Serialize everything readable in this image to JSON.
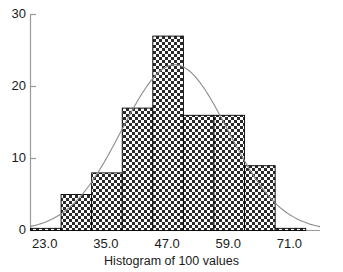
{
  "chart_data": {
    "type": "bar",
    "title": "",
    "xlabel": "Histogram of 100 values",
    "ylabel": "",
    "xlim": [
      20.2,
      77.0
    ],
    "ylim": [
      0,
      30
    ],
    "grid": false,
    "legend": null,
    "bin_width": 6,
    "bin_edges": [
      20.2,
      26.2,
      32.2,
      38.2,
      44.2,
      50.2,
      56.2,
      62.2,
      68.2,
      74.2
    ],
    "categories": [
      "20.2-26.2",
      "26.2-32.2",
      "32.2-38.2",
      "38.2-44.2",
      "44.2-50.2",
      "50.2-56.2",
      "56.2-62.2",
      "62.2-68.2",
      "68.2-74.2"
    ],
    "values": [
      0.3,
      5,
      8,
      17,
      27,
      16,
      16,
      9,
      0.3
    ],
    "xticks": [
      23.0,
      35.0,
      47.0,
      59.0,
      71.0
    ],
    "xtick_labels": [
      "23.0",
      "35.0",
      "47.0",
      "59.0",
      "71.0"
    ],
    "yticks": [
      0,
      10,
      20,
      30
    ],
    "ytick_labels": [
      "0",
      "10",
      "20",
      "30"
    ],
    "overlay": {
      "name": "normal-density-curve",
      "type": "line",
      "peak_x": 48.5,
      "peak_y": 23.0,
      "mean": 48.5,
      "sd": 10.4,
      "total": 100
    },
    "colors": {
      "bar_fill": "#3a3a3a",
      "bar_edge": "#000000",
      "curve": "#8c8c8c",
      "axis": "#9a9a9a",
      "text": "#1a1a1a"
    }
  }
}
